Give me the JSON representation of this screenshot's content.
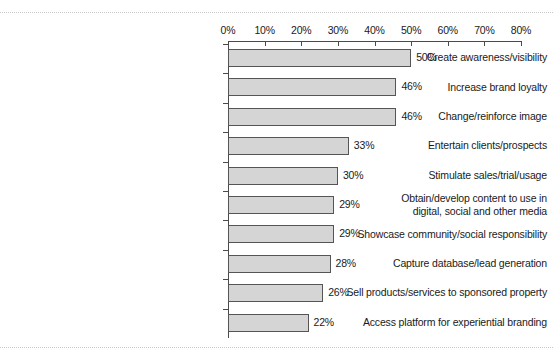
{
  "chart_data": {
    "type": "bar",
    "orientation": "horizontal",
    "title": "",
    "subtitle": "",
    "xlabel": "",
    "ylabel": "",
    "xlim": [
      0,
      80
    ],
    "xtick_step": 10,
    "grid": false,
    "legend": null,
    "value_suffix": "%",
    "categories": [
      "Create awareness/visibility",
      "Increase brand loyalty",
      "Change/reinforce image",
      "Entertain clients/prospects",
      "Stimulate sales/trial/usage",
      "Obtain/develop content to use in\ndigital, social and other media",
      "Showcase community/social responsibility",
      "Capture database/lead generation",
      "Sell products/services to sponsored property",
      "Access platform for experiential branding"
    ],
    "values": [
      50,
      46,
      46,
      33,
      30,
      29,
      29,
      28,
      26,
      22
    ],
    "value_labels": [
      "50%",
      "46%",
      "46%",
      "33%",
      "30%",
      "29%",
      "29%",
      "28%",
      "26%",
      "22%"
    ],
    "xtick_labels": [
      "0%",
      "10%",
      "20%",
      "30%",
      "40%",
      "50%",
      "60%",
      "70%",
      "80%"
    ],
    "xtick_values": [
      0,
      10,
      20,
      30,
      40,
      50,
      60,
      70,
      80
    ],
    "colors": {
      "bar_fill": "#d5d5d5",
      "bar_border": "#555555",
      "axis": "#4a4a4a",
      "text": "#1a1a1a",
      "background": "#ffffff"
    }
  }
}
